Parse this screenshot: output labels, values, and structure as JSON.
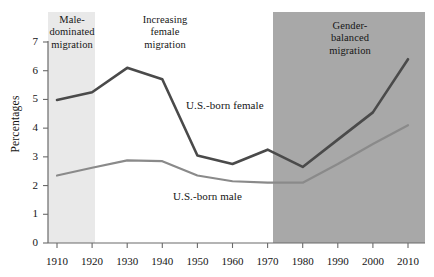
{
  "chart_data": {
    "type": "line",
    "title": "",
    "xlabel": "",
    "ylabel": "Percentages",
    "x": [
      1910,
      1920,
      1930,
      1940,
      1950,
      1960,
      1970,
      1980,
      1990,
      2000,
      2010
    ],
    "xlim": [
      1905,
      2015
    ],
    "ylim": [
      0,
      7
    ],
    "yticks": [
      0,
      1,
      2,
      3,
      4,
      5,
      6,
      7
    ],
    "xticks": [
      "1910",
      "1920",
      "1930",
      "1940",
      "1950",
      "1960",
      "1970",
      "1980",
      "1990",
      "2000",
      "2010"
    ],
    "grid": false,
    "legend_position": "inline-labels",
    "series": [
      {
        "name": "U.S.-born female",
        "color": "#4a4a4a",
        "values": [
          4.98,
          5.25,
          6.1,
          5.7,
          3.05,
          2.75,
          3.25,
          2.65,
          3.6,
          4.55,
          6.4
        ]
      },
      {
        "name": "U.S.-born male",
        "color": "#8a8a8a",
        "values": [
          2.35,
          2.62,
          2.88,
          2.85,
          2.35,
          2.15,
          2.1,
          2.1,
          2.75,
          3.45,
          4.1
        ]
      }
    ],
    "annotations": [
      {
        "id": "male-dominated",
        "text": "Male-\ndominated\nmigration",
        "lines": [
          "Male-",
          "dominated",
          "migration"
        ],
        "band_start": 1910,
        "band_end": 1920,
        "band_color": "#e9e9e9"
      },
      {
        "id": "increasing-female",
        "text": "Increasing\nfemale\nmigration",
        "lines": [
          "Increasing",
          "female",
          "migration"
        ],
        "band_start": 1920,
        "band_end": 1970,
        "band_color": "#ffffff"
      },
      {
        "id": "gender-balanced",
        "text": "Gender-\nbalanced\nmigration",
        "lines": [
          "Gender-",
          "balanced",
          "migration"
        ],
        "band_start": 1970,
        "band_end": 2010,
        "band_color": "#a8a8a8"
      }
    ]
  },
  "axis": {
    "y_label": "Percentages",
    "y_ticks": [
      "7",
      "6",
      "5",
      "4",
      "3",
      "2",
      "1",
      "0"
    ],
    "x_ticks": [
      "1910",
      "1920",
      "1930",
      "1940",
      "1950",
      "1960",
      "1970",
      "1980",
      "1990",
      "2000",
      "2010"
    ]
  },
  "series_labels": {
    "female": "U.S.-born female",
    "male": "U.S.-born male"
  },
  "bands": {
    "male": {
      "l1": "Male-",
      "l2": "dominated",
      "l3": "migration"
    },
    "mid": {
      "l1": "Increasing",
      "l2": "female",
      "l3": "migration"
    },
    "balanced": {
      "l1": "Gender-",
      "l2": "balanced",
      "l3": "migration"
    }
  },
  "colors": {
    "female_line": "#4a4a4a",
    "male_line": "#8a8a8a",
    "band_light": "#e9e9e9",
    "band_dark": "#a8a8a8",
    "axis": "#6a6a6a"
  }
}
